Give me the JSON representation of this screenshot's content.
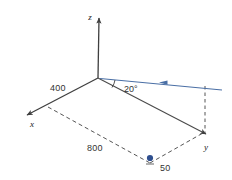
{
  "figure": {
    "background_color": "#ffffff"
  },
  "colors": {
    "axis": "#3f3f3f",
    "solid_line": "#4a4a4a",
    "dashed_line": "#555555",
    "blue_line": "#4a6fa5",
    "blue_dot": "#2f4f8f",
    "text": "#333333"
  },
  "axes": [
    {
      "name": "z-axis",
      "label": "z",
      "label_x": 92,
      "label_y": 19,
      "direction": "up"
    },
    {
      "name": "x-axis",
      "label": "x",
      "label_x": 32,
      "label_y": 126,
      "direction": "down-left"
    },
    {
      "name": "y-axis",
      "label": "y",
      "label_x": 206,
      "label_y": 149,
      "direction": "down-right"
    }
  ],
  "dimensions": [
    {
      "name": "dim-400",
      "value": "400",
      "x": 50,
      "y": 91,
      "along": "x-axis"
    },
    {
      "name": "dim-800",
      "value": "800",
      "x": 87,
      "y": 151,
      "along": "lower-dashed-edge"
    },
    {
      "name": "dim-50",
      "value": "50",
      "x": 160,
      "y": 171,
      "along": "dot-offset"
    }
  ],
  "angle": {
    "name": "angle-20",
    "value": "20°",
    "x": 124,
    "y": 92,
    "between": "blue-line and y-axis-edge"
  },
  "markers": [
    {
      "name": "blue-point",
      "x": 150,
      "y": 158,
      "radius": 3,
      "color": "#2f4f8f"
    }
  ],
  "blue_arrow": {
    "name": "blue-incoming-ray",
    "from_x": 222,
    "from_y": 90,
    "to_x": 99,
    "to_y": 78,
    "arrowhead_x": 160,
    "arrowhead_y": 83,
    "color": "#4a6fa5"
  },
  "geometry": {
    "origin": {
      "x": 98,
      "y": 78
    },
    "z_tip": {
      "x": 99,
      "y": 14
    },
    "x_tip": {
      "x": 23,
      "y": 118
    },
    "y_tip": {
      "x": 209,
      "y": 137
    },
    "x_corner": {
      "x": 48,
      "y": 107
    },
    "y_corner": {
      "x": 203,
      "y": 133
    },
    "far_corner": {
      "x": 150,
      "y": 163
    },
    "vertical_drop_top": {
      "x": 205,
      "y": 86
    },
    "vertical_drop_bottom": {
      "x": 205,
      "y": 133
    }
  }
}
